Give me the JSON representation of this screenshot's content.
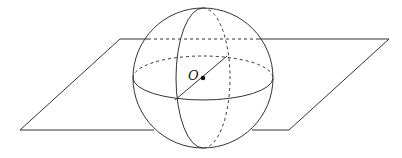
{
  "figure": {
    "labels": {
      "center": "O"
    },
    "colors": {
      "stroke": "#333333",
      "background": "#ffffff"
    },
    "plane": {
      "points": [
        [
          120,
          39
        ],
        [
          389,
          39
        ],
        [
          289,
          130
        ],
        [
          20,
          130
        ]
      ]
    },
    "sphere": {
      "cx": 203,
      "cy": 78,
      "r": 70
    }
  }
}
